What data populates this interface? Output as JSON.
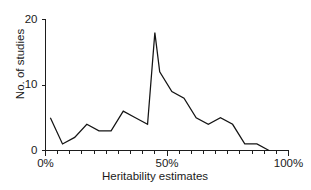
{
  "chart_data": {
    "type": "line",
    "title": "",
    "xlabel": "Heritability estimates",
    "ylabel": "No. of studies",
    "xlim": [
      0,
      100
    ],
    "ylim": [
      0,
      20
    ],
    "grid": false,
    "legend": null,
    "x_tick_labels": [
      "0%",
      "50%",
      "100%"
    ],
    "x_tick_values": [
      0,
      50,
      100
    ],
    "y_tick_labels": [
      "0",
      "10",
      "20"
    ],
    "y_tick_values": [
      0,
      10,
      20
    ],
    "x_minor_tick_interval": 5,
    "x": [
      2,
      7,
      12,
      17,
      22,
      27,
      32,
      37,
      42,
      45,
      47,
      52,
      57,
      62,
      67,
      72,
      77,
      82,
      87,
      92
    ],
    "values": [
      5,
      1,
      2,
      4,
      3,
      3,
      6,
      5,
      4,
      18,
      12,
      9,
      8,
      5,
      4,
      5,
      4,
      1,
      1,
      0
    ],
    "series": [
      {
        "name": "No. of studies",
        "points": [
          {
            "x": 2,
            "y": 5
          },
          {
            "x": 7,
            "y": 1
          },
          {
            "x": 12,
            "y": 2
          },
          {
            "x": 17,
            "y": 4
          },
          {
            "x": 22,
            "y": 3
          },
          {
            "x": 27,
            "y": 3
          },
          {
            "x": 32,
            "y": 6
          },
          {
            "x": 37,
            "y": 5
          },
          {
            "x": 42,
            "y": 4
          },
          {
            "x": 45,
            "y": 18
          },
          {
            "x": 47,
            "y": 12
          },
          {
            "x": 52,
            "y": 9
          },
          {
            "x": 57,
            "y": 8
          },
          {
            "x": 62,
            "y": 5
          },
          {
            "x": 67,
            "y": 4
          },
          {
            "x": 72,
            "y": 5
          },
          {
            "x": 77,
            "y": 4
          },
          {
            "x": 82,
            "y": 1
          },
          {
            "x": 87,
            "y": 1
          },
          {
            "x": 92,
            "y": 0
          }
        ]
      }
    ],
    "line_color": "#141414",
    "axis_color": "#1d1d1d",
    "background_color": "#ffffff"
  }
}
